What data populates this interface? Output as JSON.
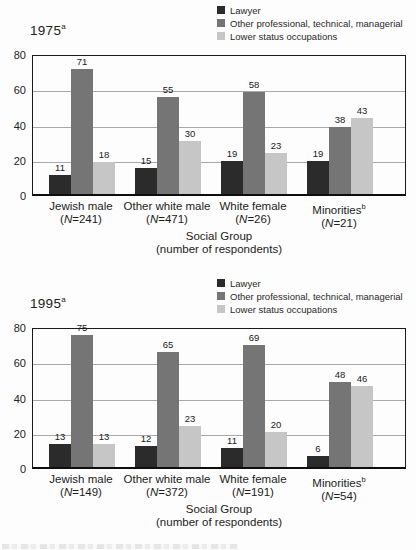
{
  "colors": {
    "lawyer": "#2b2b2b",
    "other_professional": "#757575",
    "lower_status": "#c6c6c6",
    "gridline": "#a9a9a9",
    "frame": "#1a1a1a"
  },
  "legend": {
    "items": [
      {
        "label": "Lawyer",
        "color": "lawyer"
      },
      {
        "label": "Other professional, technical, managerial",
        "color": "other_professional"
      },
      {
        "label": "Lower status occupations",
        "color": "lower_status"
      }
    ]
  },
  "chart_data": [
    {
      "type": "bar",
      "title": "1975",
      "title_superscript": "a",
      "ylim": [
        0,
        80
      ],
      "yticks": [
        80,
        60,
        40,
        20,
        0
      ],
      "grid": true,
      "legend_position": "top-right",
      "xlabel": "Social Group",
      "xlabel_note": "(number of respondents)",
      "categories": [
        {
          "label": "Jewish male",
          "superscript": "",
          "n_label": "(N=241)"
        },
        {
          "label": "Other white male",
          "superscript": "",
          "n_label": "(N=471)"
        },
        {
          "label": "White female",
          "superscript": "",
          "n_label": "(N=26)"
        },
        {
          "label": "Minorities",
          "superscript": "b",
          "n_label": "(N=21)"
        }
      ],
      "series": [
        {
          "name": "Lawyer",
          "color": "lawyer",
          "values": [
            11,
            15,
            19,
            19
          ]
        },
        {
          "name": "Other professional, technical, managerial",
          "color": "other_professional",
          "values": [
            71,
            55,
            58,
            38
          ]
        },
        {
          "name": "Lower status occupations",
          "color": "lower_status",
          "values": [
            18,
            30,
            23,
            43
          ]
        }
      ]
    },
    {
      "type": "bar",
      "title": "1995",
      "title_superscript": "a",
      "ylim": [
        0,
        80
      ],
      "yticks": [
        80,
        60,
        40,
        20,
        0
      ],
      "grid": true,
      "legend_position": "top-right",
      "xlabel": "Social Group",
      "xlabel_note": "(number of respondents)",
      "categories": [
        {
          "label": "Jewish male",
          "superscript": "",
          "n_label": "(N=149)"
        },
        {
          "label": "Other white male",
          "superscript": "",
          "n_label": "(N=372)"
        },
        {
          "label": "White female",
          "superscript": "",
          "n_label": "(N=191)"
        },
        {
          "label": "Minorities",
          "superscript": "b",
          "n_label": "(N=54)"
        }
      ],
      "series": [
        {
          "name": "Lawyer",
          "color": "lawyer",
          "values": [
            13,
            12,
            11,
            6
          ]
        },
        {
          "name": "Other professional, technical, managerial",
          "color": "other_professional",
          "values": [
            75,
            65,
            69,
            48
          ]
        },
        {
          "name": "Lower status occupations",
          "color": "lower_status",
          "values": [
            13,
            23,
            20,
            46
          ]
        }
      ]
    }
  ]
}
